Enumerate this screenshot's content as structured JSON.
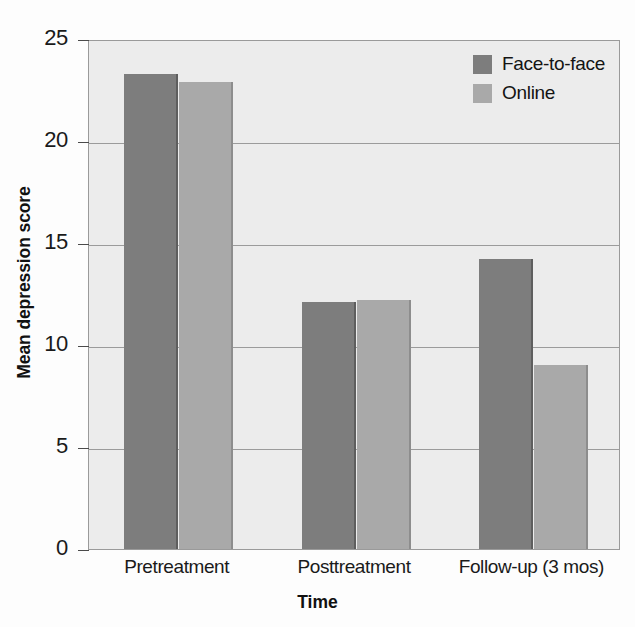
{
  "chart_data": {
    "type": "bar",
    "title": "",
    "xlabel": "Time",
    "ylabel": "Mean depression score",
    "categories": [
      "Pretreatment",
      "Posttreatment",
      "Follow-up (3 mos)"
    ],
    "series": [
      {
        "name": "Face-to-face",
        "color": "#7d7d7d",
        "values": [
          23.3,
          12.1,
          14.2
        ]
      },
      {
        "name": "Online",
        "color": "#a9a9a9",
        "values": [
          22.9,
          12.2,
          9.0
        ]
      }
    ],
    "ylim": [
      0,
      25
    ],
    "yticks": [
      0,
      5,
      10,
      15,
      20,
      25
    ],
    "ytick_labels": [
      "0",
      "5",
      "10",
      "15",
      "20",
      "25"
    ],
    "grid": true,
    "legend_position": "top-right",
    "plot_background": "#ececec"
  }
}
